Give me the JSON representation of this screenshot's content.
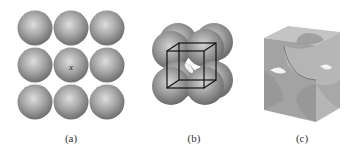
{
  "figure": {
    "panels": [
      {
        "id": "a",
        "label": "(a)",
        "description": "3x3 square layer of spheres",
        "center_marker": "x"
      },
      {
        "id": "b",
        "label": "(b)",
        "description": "stacked spheres with cubic unit cell outline"
      },
      {
        "id": "c",
        "label": "(c)",
        "description": "unit cube with sphere segments at corners and faces"
      }
    ]
  },
  "colors": {
    "sphere": "#8a8a8a",
    "sphere_highlight": "#d8d8d8",
    "cube_line": "#111111",
    "cube_top": "#c2c2c2",
    "cube_left": "#9e9e9e",
    "cube_right": "#b3b3b3"
  }
}
